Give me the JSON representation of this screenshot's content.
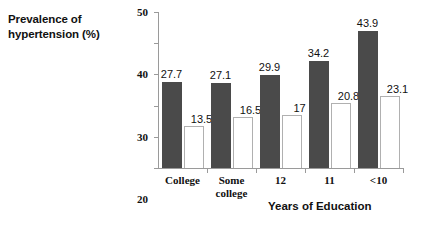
{
  "chart_data": {
    "type": "bar",
    "title": "",
    "categories": [
      "College",
      "Some\ncollege",
      "12",
      "11",
      "<10"
    ],
    "series": [
      {
        "name": "series-1",
        "color": "#4a4a4a",
        "values": [
          27.7,
          27.1,
          29.9,
          34.2,
          43.9
        ],
        "labels": [
          "27.7",
          "27.1",
          "29.9",
          "34.2",
          "43.9"
        ]
      },
      {
        "name": "series-2",
        "color": "#ffffff",
        "values": [
          13.5,
          16.5,
          17,
          20.8,
          23.1
        ],
        "labels": [
          "13.5",
          "16.5",
          "17",
          "20.8",
          "23.1"
        ]
      }
    ],
    "ylabel": "Prevalence of hypertension (%)",
    "ylabel_lines": [
      "Prevalence of",
      "hypertension (%)"
    ],
    "xlabel": "Years of Education",
    "ylim": [
      0,
      50
    ],
    "yticks": [
      0,
      10,
      20,
      30,
      40,
      50
    ],
    "ytick_labels": [
      "0",
      "10",
      "20",
      "30",
      "40",
      "50"
    ],
    "grid": false,
    "legend": "none"
  },
  "axis": {
    "y_title_line1": "Prevalence of",
    "y_title_line2": "hypertension (%)",
    "x_title": "Years of Education"
  }
}
